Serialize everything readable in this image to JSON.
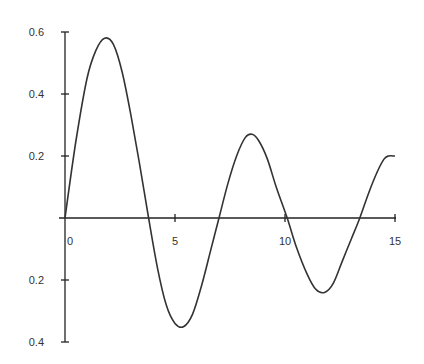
{
  "chart_data": {
    "type": "line",
    "title": "",
    "xlabel": "",
    "ylabel": "",
    "xlim": [
      0,
      15
    ],
    "ylim": [
      -0.4,
      0.6
    ],
    "grid": false,
    "legend": null,
    "x_ticks": [
      {
        "value": 0,
        "label": "0"
      },
      {
        "value": 5,
        "label": "5"
      },
      {
        "value": 10,
        "label": "10"
      },
      {
        "value": 15,
        "label": "15"
      }
    ],
    "y_ticks": [
      {
        "value": 0.6,
        "label": "0.6"
      },
      {
        "value": 0.4,
        "label": "0.4"
      },
      {
        "value": 0.2,
        "label": "0.2"
      },
      {
        "value": -0.2,
        "label": "0.2"
      },
      {
        "value": -0.4,
        "label": "0.4"
      }
    ],
    "series": [
      {
        "name": "damped oscillation",
        "color": "#333333",
        "x": [
          0,
          0.5,
          1.0,
          1.4,
          1.8,
          2.2,
          2.6,
          3.0,
          3.4,
          3.8,
          4.2,
          4.6,
          5.0,
          5.4,
          5.8,
          6.2,
          6.6,
          7.0,
          7.4,
          7.8,
          8.2,
          8.5,
          8.8,
          9.2,
          9.6,
          10.1,
          10.5,
          11.0,
          11.4,
          11.8,
          12.2,
          12.6,
          13.0,
          13.4,
          13.8,
          14.2,
          14.5,
          14.7,
          15.0
        ],
        "values": [
          0,
          0.25,
          0.45,
          0.54,
          0.58,
          0.56,
          0.47,
          0.33,
          0.17,
          0.0,
          -0.16,
          -0.28,
          -0.34,
          -0.35,
          -0.31,
          -0.22,
          -0.11,
          0.0,
          0.11,
          0.2,
          0.26,
          0.27,
          0.25,
          0.19,
          0.1,
          0.0,
          -0.09,
          -0.18,
          -0.23,
          -0.24,
          -0.21,
          -0.14,
          -0.07,
          0.0,
          0.08,
          0.15,
          0.19,
          0.2,
          0.2
        ]
      }
    ]
  }
}
